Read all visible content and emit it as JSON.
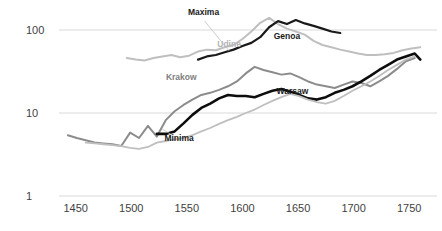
{
  "chart_data": {
    "type": "line",
    "title": "",
    "xlabel": "",
    "ylabel": "",
    "scale": "log",
    "xlim": [
      1435,
      1775
    ],
    "ylim": [
      1,
      200
    ],
    "grid": true,
    "gridlines_y": [
      1,
      10,
      100
    ],
    "legend_position": "inline-labels",
    "yticks": [
      "100",
      "10",
      "1"
    ],
    "ytick_values": [
      100,
      10,
      1
    ],
    "xticks": [
      "1450",
      "1500",
      "1550",
      "1600",
      "1650",
      "1700",
      "1750"
    ],
    "xtick_values": [
      1450,
      1500,
      1550,
      1600,
      1650,
      1700,
      1750
    ],
    "annotations": [
      {
        "text": "Maxima",
        "x": 1565,
        "y": 150,
        "color": "#1a1a1a"
      },
      {
        "text": "Udine",
        "x": 1588,
        "y": 62,
        "color": "#b5b5b5"
      },
      {
        "text": "Genoa",
        "x": 1640,
        "y": 78,
        "color": "#1a1a1a"
      },
      {
        "text": "Krakow",
        "x": 1545,
        "y": 25,
        "color": "#808080"
      },
      {
        "text": "Warsaw",
        "x": 1645,
        "y": 17,
        "color": "#1a1a1a"
      },
      {
        "text": "Minima",
        "x": 1543,
        "y": 4.6,
        "color": "#1a1a1a"
      }
    ],
    "colors": {
      "udine_max": "#bfbfbf",
      "genoa_max": "#1a1a1a",
      "krakow": "#8c8c8c",
      "warsaw": "#0d0d0d",
      "udine_min": "#bfbfbf",
      "grid": "#d9d9d9",
      "axis": "#c8c8c8",
      "text": "#3f3f3f"
    },
    "series": [
      {
        "name": "Udine maxima",
        "color_key": "udine_max",
        "width": 2.0,
        "x": [
          1496,
          1504,
          1512,
          1520,
          1528,
          1536,
          1544,
          1552,
          1560,
          1568,
          1576,
          1584,
          1592,
          1600,
          1608,
          1616,
          1624,
          1632,
          1640,
          1648,
          1656,
          1664,
          1672,
          1680,
          1688,
          1696,
          1704,
          1712,
          1720,
          1728,
          1736,
          1744,
          1752,
          1760
        ],
        "values": [
          46,
          44,
          43,
          46,
          48,
          50,
          47,
          49,
          55,
          58,
          57,
          62,
          66,
          78,
          96,
          122,
          140,
          118,
          104,
          96,
          88,
          74,
          66,
          62,
          58,
          55,
          52,
          50,
          50,
          51,
          53,
          57,
          60,
          62
        ]
      },
      {
        "name": "Genoa maxima",
        "color_key": "genoa_max",
        "width": 2.2,
        "x": [
          1560,
          1568,
          1576,
          1584,
          1592,
          1600,
          1608,
          1616,
          1624,
          1632,
          1640,
          1648,
          1656,
          1664,
          1672,
          1680,
          1688
        ],
        "values": [
          44,
          48,
          50,
          54,
          58,
          64,
          70,
          82,
          108,
          128,
          118,
          132,
          120,
          112,
          104,
          96,
          92
        ]
      },
      {
        "name": "Krakow",
        "color_key": "krakow",
        "width": 2.0,
        "x": [
          1443,
          1451,
          1459,
          1467,
          1475,
          1483,
          1491,
          1499,
          1507,
          1515,
          1523,
          1531,
          1539,
          1547,
          1555,
          1563,
          1571,
          1579,
          1587,
          1595,
          1603,
          1611,
          1619,
          1627,
          1635,
          1643,
          1651,
          1659,
          1667,
          1675,
          1683,
          1691,
          1699,
          1707,
          1715,
          1723,
          1731,
          1739,
          1747,
          1755
        ],
        "values": [
          5.4,
          5.0,
          4.7,
          4.4,
          4.3,
          4.2,
          4.0,
          5.8,
          5.0,
          7.0,
          5.2,
          8.2,
          10.5,
          12.5,
          14.5,
          16.5,
          17.5,
          19.0,
          21.0,
          24.0,
          30.0,
          36.0,
          33.0,
          31.0,
          29.0,
          30.0,
          27.0,
          24.0,
          22.0,
          21.0,
          20.0,
          22.0,
          24.0,
          23.0,
          21.0,
          24.0,
          28.0,
          34.0,
          42.0,
          46.0
        ]
      },
      {
        "name": "Warsaw",
        "color_key": "warsaw",
        "width": 2.6,
        "x": [
          1523,
          1531,
          1539,
          1547,
          1555,
          1563,
          1571,
          1579,
          1587,
          1595,
          1603,
          1611,
          1619,
          1627,
          1635,
          1643,
          1651,
          1659,
          1667,
          1675,
          1683,
          1691,
          1699,
          1707,
          1715,
          1723,
          1731,
          1739,
          1747,
          1755,
          1760
        ],
        "values": [
          5.6,
          5.6,
          6.0,
          7.5,
          9.5,
          11.5,
          13.0,
          15.0,
          16.5,
          16.0,
          16.0,
          15.5,
          17.0,
          18.5,
          19.5,
          18.0,
          16.5,
          15.0,
          14.5,
          15.5,
          17.5,
          19.0,
          21.0,
          24.0,
          28.0,
          33.0,
          38.0,
          44.0,
          48.0,
          52.0,
          44.0
        ]
      },
      {
        "name": "Udine minima",
        "color_key": "udine_min",
        "width": 1.8,
        "x": [
          1459,
          1467,
          1475,
          1483,
          1491,
          1499,
          1507,
          1515,
          1523,
          1531,
          1539,
          1547,
          1555,
          1563,
          1571,
          1579,
          1587,
          1595,
          1603,
          1611,
          1619,
          1627,
          1635,
          1643,
          1651,
          1659,
          1667,
          1675,
          1683,
          1691,
          1699,
          1707,
          1715,
          1723,
          1731,
          1739,
          1747,
          1755
        ],
        "values": [
          4.4,
          4.3,
          4.2,
          4.1,
          4.0,
          3.8,
          3.7,
          3.9,
          4.4,
          4.6,
          4.8,
          5.0,
          5.4,
          6.0,
          6.6,
          7.4,
          8.2,
          9.0,
          10.0,
          11.0,
          12.5,
          14.0,
          15.5,
          17.0,
          16.0,
          14.5,
          13.5,
          13.0,
          14.0,
          16.0,
          18.5,
          21.0,
          24.0,
          28.0,
          33.0,
          38.0,
          44.0,
          48.0
        ]
      }
    ],
    "leaders": [
      {
        "name": "maxima-leader",
        "x1": 1566,
        "y1": 128,
        "x2": 1588,
        "y2": 56
      },
      {
        "name": "minima-leader",
        "x1": 1538,
        "y1": 5.3,
        "x2": 1528,
        "y2": 6.4
      }
    ]
  }
}
